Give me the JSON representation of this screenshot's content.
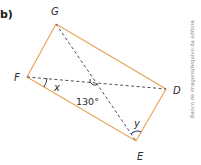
{
  "item_label": "b)",
  "figure": {
    "shape": "rectangle",
    "vertices": {
      "G": {
        "label": "G"
      },
      "D": {
        "label": "D"
      },
      "E": {
        "label": "E"
      },
      "F": {
        "label": "F"
      }
    },
    "diagonals": [
      "GE",
      "FD"
    ],
    "angles": {
      "center": {
        "label": "130°"
      },
      "at_F": {
        "label": "x"
      },
      "at_E": {
        "label": "y"
      }
    }
  },
  "colors": {
    "rectangle": "#e8a65a",
    "diagonals": "#3a3a4a",
    "angle_arc": "#2b3a8c",
    "text": "#2a2a2a"
  },
  "credit": "Banco de imagens/Arquivo da editora"
}
